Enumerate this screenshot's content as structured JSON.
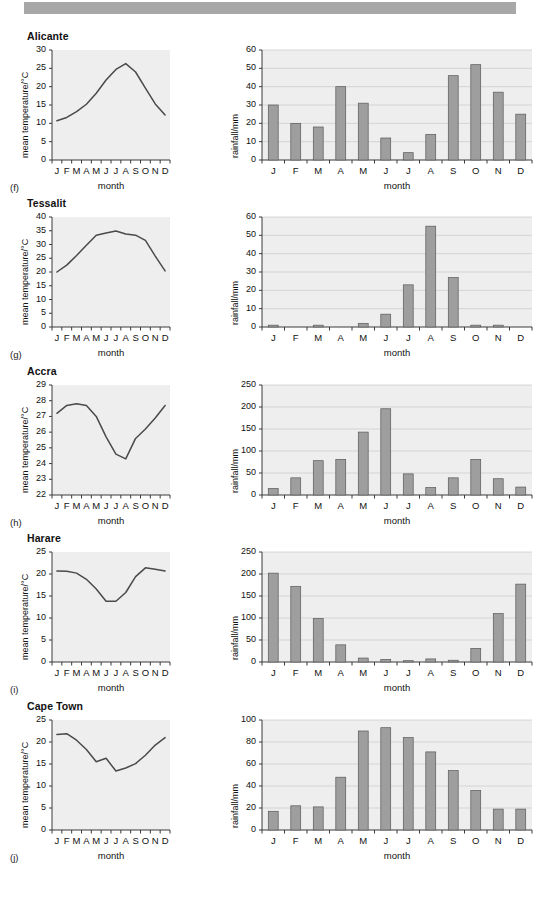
{
  "page": {
    "top_bar_color": "#a8a8a8",
    "background": "#ffffff",
    "plot_background": "#eeeeee",
    "bar_fill": "#9e9e9e",
    "bar_stroke": "#5a5a5a",
    "line_color": "#4a4a4a",
    "grid_color": "#c9c9c9"
  },
  "axis_titles": {
    "temperature_y": "mean temperature/°C",
    "rainfall_y": "rainfall/mm",
    "x": "month"
  },
  "months": [
    "J",
    "F",
    "M",
    "A",
    "M",
    "J",
    "J",
    "A",
    "S",
    "O",
    "N",
    "D"
  ],
  "panels": [
    {
      "city": "Alicante",
      "fig_label": "(f)",
      "temperature": {
        "type": "line",
        "title": "Alicante",
        "xlabel": "month",
        "ylabel": "mean temperature/°C",
        "categories": [
          "J",
          "F",
          "M",
          "A",
          "M",
          "J",
          "J",
          "A",
          "S",
          "O",
          "N",
          "D"
        ],
        "values": [
          10.7,
          11.6,
          13.2,
          15.2,
          18.2,
          21.8,
          24.7,
          26.3,
          24.0,
          19.6,
          15.3,
          12.3
        ],
        "ylim": [
          0,
          30
        ],
        "yticks": [
          0,
          5,
          10,
          15,
          20,
          25,
          30
        ],
        "grid": false
      },
      "rainfall": {
        "type": "bar",
        "xlabel": "month",
        "ylabel": "rainfall/mm",
        "categories": [
          "J",
          "F",
          "M",
          "A",
          "M",
          "J",
          "J",
          "A",
          "S",
          "O",
          "N",
          "D"
        ],
        "values": [
          30,
          20,
          18,
          40,
          31,
          12,
          4,
          14,
          46,
          52,
          37,
          25
        ],
        "ylim": [
          0,
          60
        ],
        "yticks": [
          0,
          10,
          20,
          30,
          40,
          50,
          60
        ],
        "grid": true
      }
    },
    {
      "city": "Tessalit",
      "fig_label": "(g)",
      "temperature": {
        "type": "line",
        "title": "Tessalit",
        "xlabel": "month",
        "ylabel": "mean temperature/°C",
        "categories": [
          "J",
          "F",
          "M",
          "A",
          "M",
          "J",
          "J",
          "A",
          "S",
          "O",
          "N",
          "D"
        ],
        "values": [
          20.0,
          22.5,
          26.0,
          29.7,
          33.4,
          34.2,
          34.9,
          33.8,
          33.4,
          31.5,
          25.8,
          20.4
        ],
        "ylim": [
          0,
          40
        ],
        "yticks": [
          0,
          5,
          10,
          15,
          20,
          25,
          30,
          35,
          40
        ],
        "grid": false
      },
      "rainfall": {
        "type": "bar",
        "xlabel": "month",
        "ylabel": "rainfall/mm",
        "categories": [
          "J",
          "F",
          "M",
          "A",
          "M",
          "J",
          "J",
          "A",
          "S",
          "O",
          "N",
          "D"
        ],
        "values": [
          1,
          0,
          1,
          0,
          2,
          7,
          23,
          55,
          27,
          1,
          1,
          0
        ],
        "ylim": [
          0,
          60
        ],
        "yticks": [
          0,
          10,
          20,
          30,
          40,
          50,
          60
        ],
        "grid": true
      }
    },
    {
      "city": "Accra",
      "fig_label": "(h)",
      "temperature": {
        "type": "line",
        "title": "Accra",
        "xlabel": "month",
        "ylabel": "mean temperature/°C",
        "categories": [
          "J",
          "F",
          "M",
          "A",
          "M",
          "J",
          "J",
          "A",
          "S",
          "O",
          "N",
          "D"
        ],
        "values": [
          27.2,
          27.7,
          27.8,
          27.7,
          27.0,
          25.7,
          24.6,
          24.3,
          25.6,
          26.2,
          26.9,
          27.7
        ],
        "ylim": [
          22,
          29
        ],
        "yticks": [
          22,
          23,
          24,
          25,
          26,
          27,
          28,
          29
        ],
        "grid": false
      },
      "rainfall": {
        "type": "bar",
        "xlabel": "month",
        "ylabel": "rainfall/mm",
        "categories": [
          "J",
          "F",
          "M",
          "A",
          "M",
          "J",
          "J",
          "A",
          "S",
          "O",
          "N",
          "D"
        ],
        "values": [
          15,
          39,
          78,
          81,
          143,
          196,
          48,
          17,
          39,
          81,
          37,
          18
        ],
        "ylim": [
          0,
          250
        ],
        "yticks": [
          0,
          50,
          100,
          150,
          200,
          250
        ],
        "grid": true
      }
    },
    {
      "city": "Harare",
      "fig_label": "(i)",
      "temperature": {
        "type": "line",
        "title": "Harare",
        "xlabel": "month",
        "ylabel": "mean temperature/°C",
        "categories": [
          "J",
          "F",
          "M",
          "A",
          "M",
          "J",
          "J",
          "A",
          "S",
          "O",
          "N",
          "D"
        ],
        "values": [
          20.7,
          20.6,
          20.2,
          18.8,
          16.6,
          13.8,
          13.8,
          15.8,
          19.4,
          21.4,
          21.1,
          20.7
        ],
        "ylim": [
          0,
          25
        ],
        "yticks": [
          0,
          5,
          10,
          15,
          20,
          25
        ],
        "grid": false
      },
      "rainfall": {
        "type": "bar",
        "xlabel": "month",
        "ylabel": "rainfall/mm",
        "categories": [
          "J",
          "F",
          "M",
          "A",
          "M",
          "J",
          "J",
          "A",
          "S",
          "O",
          "N",
          "D"
        ],
        "values": [
          202,
          172,
          99,
          39,
          9,
          6,
          3,
          7,
          4,
          31,
          110,
          177
        ],
        "ylim": [
          0,
          250
        ],
        "yticks": [
          0,
          50,
          100,
          150,
          200,
          250
        ],
        "grid": true
      }
    },
    {
      "city": "Cape Town",
      "fig_label": "(j)",
      "temperature": {
        "type": "line",
        "title": "Cape Town",
        "xlabel": "month",
        "ylabel": "mean temperature/°C",
        "categories": [
          "J",
          "F",
          "M",
          "A",
          "M",
          "J",
          "J",
          "A",
          "S",
          "O",
          "N",
          "D"
        ],
        "values": [
          21.7,
          21.9,
          20.4,
          18.3,
          15.5,
          16.3,
          13.4,
          14.1,
          15.1,
          17.0,
          19.3,
          21.0
        ],
        "ylim": [
          0,
          25
        ],
        "yticks": [
          0,
          5,
          10,
          15,
          20,
          25
        ],
        "grid": false
      },
      "rainfall": {
        "type": "bar",
        "xlabel": "month",
        "ylabel": "rainfall/mm",
        "categories": [
          "J",
          "F",
          "M",
          "A",
          "M",
          "J",
          "J",
          "A",
          "S",
          "O",
          "N",
          "D"
        ],
        "values": [
          17,
          22,
          21,
          48,
          90,
          93,
          84,
          71,
          54,
          36,
          19,
          19
        ],
        "ylim": [
          0,
          100
        ],
        "yticks": [
          0,
          20,
          40,
          60,
          80,
          100
        ],
        "grid": true
      }
    }
  ],
  "chart_data": [
    {
      "type": "line",
      "title": "Alicante",
      "xlabel": "month",
      "ylabel": "mean temperature/°C",
      "categories": [
        "J",
        "F",
        "M",
        "A",
        "M",
        "J",
        "J",
        "A",
        "S",
        "O",
        "N",
        "D"
      ],
      "values": [
        10.7,
        11.6,
        13.2,
        15.2,
        18.2,
        21.8,
        24.7,
        26.3,
        24.0,
        19.6,
        15.3,
        12.3
      ],
      "ylim": [
        0,
        30
      ]
    },
    {
      "type": "bar",
      "title": "Alicante",
      "xlabel": "month",
      "ylabel": "rainfall/mm",
      "categories": [
        "J",
        "F",
        "M",
        "A",
        "M",
        "J",
        "J",
        "A",
        "S",
        "O",
        "N",
        "D"
      ],
      "values": [
        30,
        20,
        18,
        40,
        31,
        12,
        4,
        14,
        46,
        52,
        37,
        25
      ],
      "ylim": [
        0,
        60
      ]
    },
    {
      "type": "line",
      "title": "Tessalit",
      "xlabel": "month",
      "ylabel": "mean temperature/°C",
      "categories": [
        "J",
        "F",
        "M",
        "A",
        "M",
        "J",
        "J",
        "A",
        "S",
        "O",
        "N",
        "D"
      ],
      "values": [
        20.0,
        22.5,
        26.0,
        29.7,
        33.4,
        34.2,
        34.9,
        33.8,
        33.4,
        31.5,
        25.8,
        20.4
      ],
      "ylim": [
        0,
        40
      ]
    },
    {
      "type": "bar",
      "title": "Tessalit",
      "xlabel": "month",
      "ylabel": "rainfall/mm",
      "categories": [
        "J",
        "F",
        "M",
        "A",
        "M",
        "J",
        "J",
        "A",
        "S",
        "O",
        "N",
        "D"
      ],
      "values": [
        1,
        0,
        1,
        0,
        2,
        7,
        23,
        55,
        27,
        1,
        1,
        0
      ],
      "ylim": [
        0,
        60
      ]
    },
    {
      "type": "line",
      "title": "Accra",
      "xlabel": "month",
      "ylabel": "mean temperature/°C",
      "categories": [
        "J",
        "F",
        "M",
        "A",
        "M",
        "J",
        "J",
        "A",
        "S",
        "O",
        "N",
        "D"
      ],
      "values": [
        27.2,
        27.7,
        27.8,
        27.7,
        27.0,
        25.7,
        24.6,
        24.3,
        25.6,
        26.2,
        26.9,
        27.7
      ],
      "ylim": [
        22,
        29
      ]
    },
    {
      "type": "bar",
      "title": "Accra",
      "xlabel": "month",
      "ylabel": "rainfall/mm",
      "categories": [
        "J",
        "F",
        "M",
        "A",
        "M",
        "J",
        "J",
        "A",
        "S",
        "O",
        "N",
        "D"
      ],
      "values": [
        15,
        39,
        78,
        81,
        143,
        196,
        48,
        17,
        39,
        81,
        37,
        18
      ],
      "ylim": [
        0,
        250
      ]
    },
    {
      "type": "line",
      "title": "Harare",
      "xlabel": "month",
      "ylabel": "mean temperature/°C",
      "categories": [
        "J",
        "F",
        "M",
        "A",
        "M",
        "J",
        "J",
        "A",
        "S",
        "O",
        "N",
        "D"
      ],
      "values": [
        20.7,
        20.6,
        20.2,
        18.8,
        16.6,
        13.8,
        13.8,
        15.8,
        19.4,
        21.4,
        21.1,
        20.7
      ],
      "ylim": [
        0,
        25
      ]
    },
    {
      "type": "bar",
      "title": "Harare",
      "xlabel": "month",
      "ylabel": "rainfall/mm",
      "categories": [
        "J",
        "F",
        "M",
        "A",
        "M",
        "J",
        "J",
        "A",
        "S",
        "O",
        "N",
        "D"
      ],
      "values": [
        202,
        172,
        99,
        39,
        9,
        6,
        3,
        7,
        4,
        31,
        110,
        177
      ],
      "ylim": [
        0,
        250
      ]
    },
    {
      "type": "line",
      "title": "Cape Town",
      "xlabel": "month",
      "ylabel": "mean temperature/°C",
      "categories": [
        "J",
        "F",
        "M",
        "A",
        "M",
        "J",
        "J",
        "A",
        "S",
        "O",
        "N",
        "D"
      ],
      "values": [
        21.7,
        21.9,
        20.4,
        18.3,
        15.5,
        16.3,
        13.4,
        14.1,
        15.1,
        17.0,
        19.3,
        21.0
      ],
      "ylim": [
        0,
        25
      ]
    },
    {
      "type": "bar",
      "title": "Cape Town",
      "xlabel": "month",
      "ylabel": "rainfall/mm",
      "categories": [
        "J",
        "F",
        "M",
        "A",
        "M",
        "J",
        "J",
        "A",
        "S",
        "O",
        "N",
        "D"
      ],
      "values": [
        17,
        22,
        21,
        48,
        90,
        93,
        84,
        71,
        54,
        36,
        19,
        19
      ],
      "ylim": [
        0,
        100
      ]
    }
  ]
}
